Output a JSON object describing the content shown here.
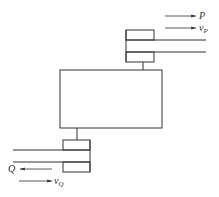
{
  "diagram": {
    "top_assembly": {
      "force_label": "P",
      "velocity_label": "v",
      "velocity_subscript": "P"
    },
    "bottom_assembly": {
      "force_label": "Q",
      "velocity_label": "v",
      "velocity_subscript": "Q"
    },
    "colors": {
      "stroke": "#333333",
      "background": "#ffffff"
    }
  }
}
